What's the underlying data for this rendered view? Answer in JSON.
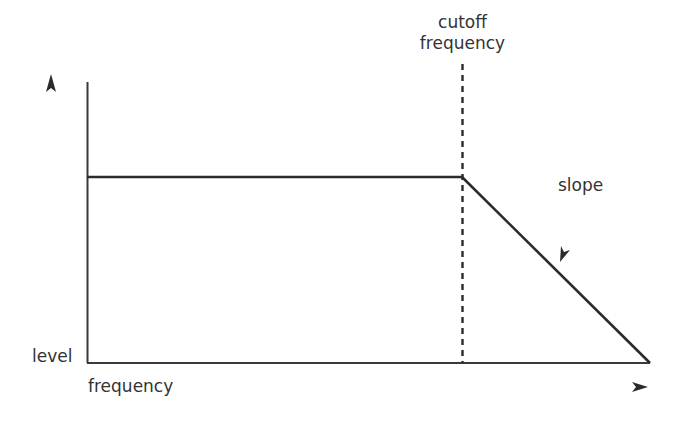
{
  "diagram": {
    "type": "low-pass filter frequency response",
    "labels": {
      "cutoff_line1": "cutoff",
      "cutoff_line2": "frequency",
      "slope": "slope",
      "y_axis": "level",
      "x_axis": "frequency"
    },
    "colors": {
      "line": "#2b2b2b",
      "text": "#333333",
      "background": "#ffffff"
    },
    "geometry": {
      "y_axis_x": 87,
      "y_axis_top": 82,
      "x_axis_y": 363,
      "passband_y": 177,
      "cutoff_x": 462,
      "end_x": 650
    }
  }
}
